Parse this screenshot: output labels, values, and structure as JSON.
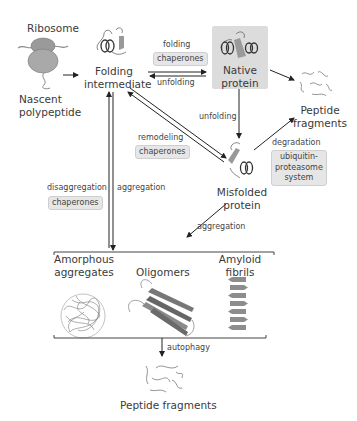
{
  "nodes": {
    "ribosome": "Ribosome",
    "nascent": [
      "Nascent",
      "polypeptide"
    ],
    "folding_intermediate": [
      "Folding",
      "intermediate"
    ],
    "native_protein": [
      "Native",
      "protein"
    ],
    "peptide_fragments_top": [
      "Peptide",
      "fragments"
    ],
    "misfolded_protein": [
      "Misfolded",
      "protein"
    ],
    "amorphous": [
      "Amorphous",
      "aggregates"
    ],
    "oligomers": "Oligomers",
    "amyloid": [
      "Amyloid",
      "fibrils"
    ],
    "peptide_fragments_bottom": "Peptide fragments"
  },
  "edges": {
    "folding": "folding",
    "folding_chaperones": "chaperones",
    "unfolding_1": "unfolding",
    "unfolding_2": "unfolding",
    "remodeling": "remodeling",
    "remodeling_chaperones": "chaperones",
    "disaggregation": "disaggregation",
    "disaggregation_chaperones": "chaperones",
    "aggregation_1": "aggregation",
    "aggregation_2": "aggregation",
    "degradation": "degradation",
    "ups": [
      "ubiquitin-",
      "proteasome",
      "system"
    ],
    "autophagy": "autophagy"
  },
  "colors": {
    "pill_bg": "#e6e6e6",
    "native_box_bg": "#dcdcdc",
    "arrow": "#222222",
    "protein_gray": "#8a8a8a"
  }
}
